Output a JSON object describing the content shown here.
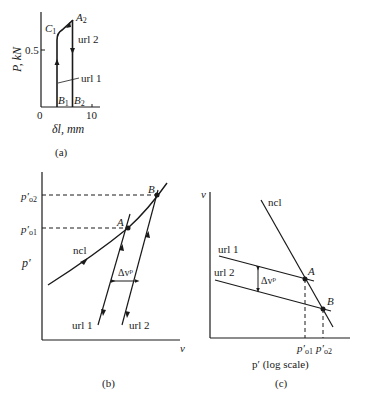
{
  "figure": {
    "panels": [
      {
        "id": "a",
        "caption": "(a)",
        "y_axis_label": "P, kN",
        "x_axis_label": "δl, mm",
        "y_tick": "0.5",
        "x_ticks": [
          "0",
          "10"
        ],
        "points": {
          "C1": "C",
          "C1_sub": "1",
          "A2": "A",
          "A2_sub": "2",
          "B1": "B",
          "B1_sub": "1",
          "B2": "B",
          "B2_sub": "2"
        },
        "lines": {
          "url1": "url 1",
          "url2": "url 2"
        }
      },
      {
        "id": "b",
        "caption": "(b)",
        "y_axis_label": "p′",
        "x_axis_label": "v",
        "y_ticks": {
          "po1": "p′",
          "po1_sub": "o1",
          "po2": "p′",
          "po2_sub": "o2"
        },
        "points": {
          "A": "A",
          "B": "B"
        },
        "lines": {
          "ncl": "ncl",
          "url1": "url 1",
          "url2": "url 2"
        },
        "delta": "Δv",
        "delta_sup": "p"
      },
      {
        "id": "c",
        "caption": "(c)",
        "y_axis_label": "v",
        "x_axis_label": "p′ (log scale)",
        "x_ticks": {
          "po1": "p′",
          "po1_sub": "o1",
          "po2": "p′",
          "po2_sub": "o2"
        },
        "points": {
          "A": "A",
          "B": "B"
        },
        "lines": {
          "ncl": "ncl",
          "url1": "url 1",
          "url2": "url 2"
        },
        "delta": "Δv",
        "delta_sup": "p"
      }
    ],
    "colors": {
      "ink": "#1a1a1a",
      "background": "#ffffff"
    }
  }
}
